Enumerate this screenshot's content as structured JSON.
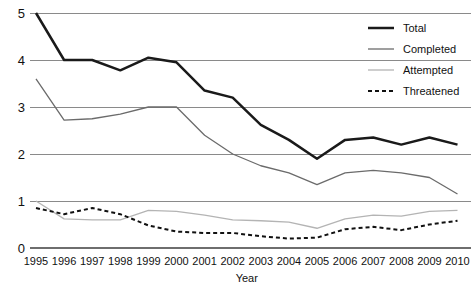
{
  "chart_data": {
    "type": "line",
    "title": "",
    "subtitle": "",
    "xlabel": "Year",
    "ylabel": "",
    "grid": true,
    "legend_position": "top-right",
    "xlim": [
      1995,
      2010
    ],
    "ylim": [
      0,
      5
    ],
    "ytick_labels": [
      "0",
      "1",
      "2",
      "3",
      "4",
      "5"
    ],
    "yticks": [
      0,
      1,
      2,
      3,
      4,
      5
    ],
    "categories": [
      1995,
      1996,
      1997,
      1998,
      1999,
      2000,
      2001,
      2002,
      2003,
      2004,
      2005,
      2006,
      2007,
      2008,
      2009,
      2010
    ],
    "xtick_labels": [
      "1995",
      "1996",
      "1997",
      "1998",
      "1999",
      "2000",
      "2001",
      "2002",
      "2003",
      "2004",
      "2005",
      "2006",
      "2007",
      "2008",
      "2009",
      "2010"
    ],
    "series": [
      {
        "name": "Total",
        "color": "#1a1a1a",
        "width": 2.5,
        "dash": "",
        "values": [
          5.0,
          4.0,
          4.0,
          3.78,
          4.05,
          3.95,
          3.35,
          3.2,
          2.62,
          2.3,
          1.9,
          2.3,
          2.35,
          2.2,
          2.35,
          2.2
        ]
      },
      {
        "name": "Completed",
        "color": "#6b6b6b",
        "width": 1.3,
        "dash": "",
        "values": [
          3.6,
          2.72,
          2.75,
          2.85,
          3.0,
          3.0,
          2.4,
          2.0,
          1.75,
          1.6,
          1.35,
          1.6,
          1.65,
          1.6,
          1.5,
          1.15
        ]
      },
      {
        "name": "Attempted",
        "color": "#b4b4b4",
        "width": 1.3,
        "dash": "",
        "values": [
          1.0,
          0.62,
          0.6,
          0.6,
          0.8,
          0.78,
          0.7,
          0.6,
          0.58,
          0.55,
          0.42,
          0.62,
          0.7,
          0.68,
          0.78,
          0.8
        ]
      },
      {
        "name": "Threatened",
        "color": "#111111",
        "width": 2.0,
        "dash": "4,3",
        "values": [
          0.85,
          0.72,
          0.85,
          0.72,
          0.48,
          0.35,
          0.32,
          0.32,
          0.25,
          0.2,
          0.22,
          0.4,
          0.45,
          0.38,
          0.5,
          0.58
        ]
      }
    ],
    "legend": [
      {
        "label": "Total",
        "color": "#1a1a1a",
        "width": 2.5,
        "dash": ""
      },
      {
        "label": "Completed",
        "color": "#6b6b6b",
        "width": 1.3,
        "dash": ""
      },
      {
        "label": "Attempted",
        "color": "#b4b4b4",
        "width": 1.3,
        "dash": ""
      },
      {
        "label": "Threatened",
        "color": "#111111",
        "width": 2.0,
        "dash": "4,3"
      }
    ]
  }
}
